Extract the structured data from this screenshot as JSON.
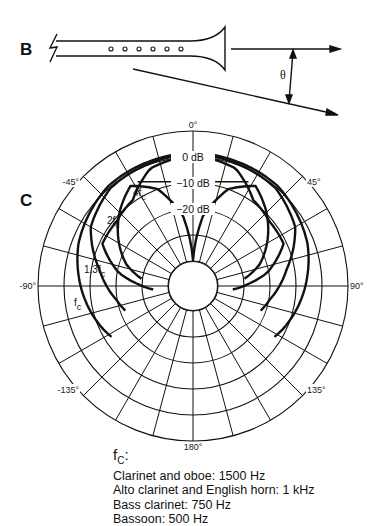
{
  "panels": {
    "b_label": "B",
    "c_label": "C"
  },
  "panel_b": {
    "angle_symbol": "θ",
    "finger_holes": 6
  },
  "polar": {
    "center": [
      193,
      286
    ],
    "outer_radius": 155,
    "inner_radius": 25,
    "ring_radii": [
      25,
      51,
      77,
      103,
      129,
      155
    ],
    "spoke_step_deg": 15,
    "angle_labels": [
      {
        "text": "0°",
        "angle": 0
      },
      {
        "text": "45°",
        "angle": 45
      },
      {
        "text": "90°",
        "angle": 90
      },
      {
        "text": "135°",
        "angle": 135
      },
      {
        "text": "180°",
        "angle": 180
      },
      {
        "text": "-135°",
        "angle": -135
      },
      {
        "text": "-90°",
        "angle": -90
      },
      {
        "text": "-45°",
        "angle": -45
      }
    ],
    "db_labels": [
      {
        "text": "0 dB",
        "radius": 129
      },
      {
        "text": "−10 dB",
        "radius": 103
      },
      {
        "text": "−20 dB",
        "radius": 77
      }
    ],
    "curve_labels": [
      {
        "text": "4f",
        "sub": "c",
        "pos": [
          133,
          196
        ]
      },
      {
        "text": "2f",
        "sub": "c",
        "pos": [
          107,
          224
        ]
      },
      {
        "text": "1.3f",
        "sub": "c",
        "pos": [
          84,
          273
        ]
      },
      {
        "text": "f",
        "sub": "c",
        "pos": [
          74,
          306
        ]
      }
    ]
  },
  "chart_data": {
    "type": "polar",
    "radial_axis": {
      "unit": "dB",
      "ticks": [
        0,
        -10,
        -20
      ],
      "range": [
        -40,
        0
      ]
    },
    "angular_axis": {
      "unit": "deg",
      "ticks": [
        0,
        45,
        90,
        135,
        180,
        -135,
        -90,
        -45
      ]
    },
    "series": [
      {
        "name": "fc",
        "description": "broad pattern, ~0 dB to ±60°, falling to about -20 dB near ±110°"
      },
      {
        "name": "1.3 fc",
        "description": "narrower, drops sharply beyond about ±75°"
      },
      {
        "name": "2 fc",
        "description": "lobed pattern, dip near ±30°, secondary lobe near ±60°"
      },
      {
        "name": "4 fc",
        "description": "narrow main lobe ±30°, deep null toward 0° inner region at ~-40 dB"
      }
    ]
  },
  "legend": {
    "header": "f",
    "header_sub": "C",
    "header_suffix": ":",
    "items": [
      "Clarinet and oboe: 1500 Hz",
      "Alto clarinet and English horn: 1 kHz",
      "Bass clarinet: 750 Hz",
      "Bassoon: 500 Hz"
    ]
  }
}
